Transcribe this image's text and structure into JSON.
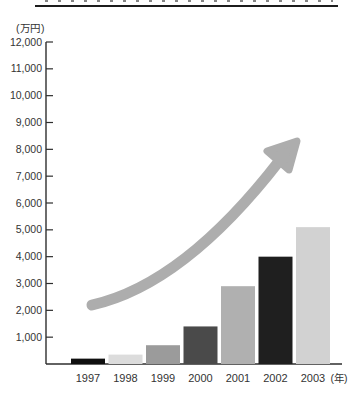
{
  "unit_label": "(万円)",
  "chart_data": {
    "type": "bar",
    "title": "",
    "unit_label": "(万円)",
    "x_axis_suffix": "(年)",
    "categories": [
      "1997",
      "1998",
      "1999",
      "2000",
      "2001",
      "2002",
      "2003"
    ],
    "values": [
      200,
      350,
      700,
      1400,
      2900,
      4000,
      5100
    ],
    "bar_colors": [
      "#0f0f0f",
      "#dcdcdc",
      "#9b9b9b",
      "#4a4a4a",
      "#b0b0b0",
      "#1f1f1f",
      "#d2d2d2"
    ],
    "ylim": [
      0,
      12000
    ],
    "ytick_step": 1000,
    "ytick_labels": [
      "1,000",
      "2,000",
      "3,000",
      "4,000",
      "5,000",
      "6,000",
      "7,000",
      "8,000",
      "9,000",
      "10,000",
      "11,000",
      "12,000"
    ],
    "grid": false,
    "legend": "none",
    "axis_color": "#2e2e2e",
    "label_color": "#333333",
    "annotation": {
      "type": "trend-arrow",
      "direction": "up-right",
      "color": "#adadad"
    }
  }
}
